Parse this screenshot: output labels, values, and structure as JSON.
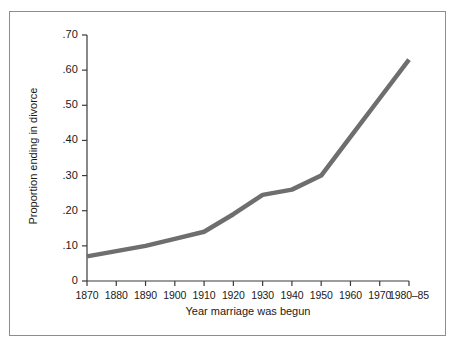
{
  "chart_data": {
    "type": "line",
    "title": "",
    "xlabel": "Year marriage was begun",
    "ylabel": "Proportion ending in divorce",
    "x_tick_labels": [
      "1870",
      "1880",
      "1890",
      "1900",
      "1910",
      "1920",
      "1930",
      "1940",
      "1950",
      "1960",
      "1970",
      "1980–85"
    ],
    "y_tick_labels": [
      "0",
      ".10",
      ".20",
      ".30",
      ".40",
      ".50",
      ".60",
      ".70"
    ],
    "y_tick_values": [
      0,
      0.1,
      0.2,
      0.3,
      0.4,
      0.5,
      0.6,
      0.7
    ],
    "ylim": [
      0,
      0.7
    ],
    "xlim": [
      0,
      11
    ],
    "grid": false,
    "legend": false,
    "series": [
      {
        "name": "Proportion ending in divorce",
        "color": "#6e6e6e",
        "line_width": 4.5,
        "categories": [
          "1870",
          "1880",
          "1890",
          "1900",
          "1910",
          "1920",
          "1930",
          "1940",
          "1950",
          "1960",
          "1970",
          "1980–85"
        ],
        "values": [
          0.07,
          0.085,
          0.1,
          0.12,
          0.14,
          0.19,
          0.245,
          0.26,
          0.3,
          0.41,
          0.52,
          0.63
        ]
      }
    ]
  },
  "figure": {
    "border_color": "#8d8d8d",
    "background": "#ffffff",
    "axis_color": "#3a3a3a"
  }
}
